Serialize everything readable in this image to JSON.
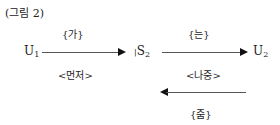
{
  "figure": {
    "title": "(그림 2)",
    "nodes": {
      "u1": {
        "base": "U",
        "sub": "1"
      },
      "s2": {
        "prefix": "|",
        "base": "S",
        "sub": "2"
      },
      "u2": {
        "base": "U",
        "sub": "2"
      }
    },
    "arrows": [
      {
        "from": "U1",
        "to": "S2",
        "label_above": "{가}",
        "label_below": "<먼저>"
      },
      {
        "from": "S2",
        "to": "U2",
        "label_above": "{는}",
        "label_below": "<나중>"
      },
      {
        "from": "U2",
        "to": "S2",
        "direction": "left",
        "label_below": "{줌}"
      }
    ]
  }
}
